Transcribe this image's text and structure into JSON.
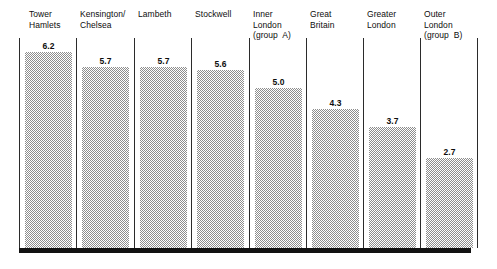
{
  "chart_data": {
    "type": "bar",
    "title": "",
    "subtitle": "",
    "xlabel": "",
    "ylabel": "",
    "grid": false,
    "legend": "none",
    "orientation": "vertical",
    "ylim": [
      0,
      6.9
    ],
    "categories": [
      "Tower\nHamlets",
      "Kensington/\nChelsea",
      "Lambeth",
      "Stockwell",
      "Inner\nLondon\n(group  A)",
      "Great\nBritain",
      "Greater\nLondon",
      "Outer\nLondon\n(group  B)"
    ],
    "values": [
      6.2,
      5.7,
      5.7,
      5.6,
      5.0,
      4.3,
      3.7,
      2.7
    ],
    "value_labels": [
      "6.2",
      "5.7",
      "5.7",
      "5.6",
      "5.0",
      "4.3",
      "3.7",
      "2.7"
    ],
    "series": [
      {
        "name": "",
        "values": [
          6.2,
          5.7,
          5.7,
          5.6,
          5.0,
          4.3,
          3.7,
          2.7
        ]
      }
    ],
    "annotations": []
  },
  "style": {
    "background": "#ffffff",
    "bar_fill": "#8d8d8d",
    "bar_pattern": "checkerboard-dither-50",
    "divider_color": "#2b2b2b",
    "baseline_color": "#111111",
    "text_color": "#0d0d0d"
  },
  "layout": {
    "category_label_x": [
      29,
      80,
      138,
      195,
      253,
      310,
      367,
      424
    ],
    "category_label_y": 9,
    "divider_x": [
      19,
      76,
      134,
      191,
      249,
      306,
      363,
      420,
      477
    ],
    "divider_top": 38,
    "divider_bottom": 248,
    "bar_x": [
      25,
      82,
      140,
      197,
      255,
      312,
      369,
      426
    ],
    "bar_width": 47,
    "bar_top": [
      52,
      67,
      67,
      70,
      88,
      109,
      127,
      158
    ],
    "baseline": {
      "x": 19,
      "y": 248,
      "width": 452,
      "height": 5
    },
    "bar_bottom": 248
  }
}
